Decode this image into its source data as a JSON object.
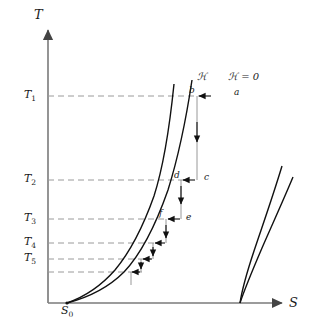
{
  "figure": {
    "type": "diagram",
    "axes": {
      "y_label": "T",
      "x_label": "S",
      "y_axis_name": "temperature-axis",
      "x_axis_name": "entropy-axis"
    },
    "origin_label": "S",
    "origin_subscript": "0",
    "field_labels": [
      {
        "name": "field-on-label",
        "text": "ℋ"
      },
      {
        "name": "field-zero-label",
        "text": "ℋ = 0"
      }
    ],
    "isotherms": [
      {
        "id": "T1",
        "label": "T",
        "subscript": "1",
        "y": 96,
        "x_end": 206,
        "style": "dashed"
      },
      {
        "id": "T2",
        "label": "T",
        "subscript": "2",
        "y": 180,
        "x_end": 188,
        "style": "dashed"
      },
      {
        "id": "T3",
        "label": "T",
        "subscript": "3",
        "y": 219,
        "x_end": 172,
        "style": "dashed"
      },
      {
        "id": "T4",
        "label": "T",
        "subscript": "4",
        "y": 243,
        "x_end": 160,
        "style": "dashed"
      },
      {
        "id": "T5",
        "label": "T",
        "subscript": "5",
        "y": 259,
        "x_end": 151,
        "style": "dashed"
      },
      {
        "id": "T6",
        "label": "",
        "subscript": "",
        "y": 272,
        "x_end": 142,
        "style": "dashed"
      }
    ],
    "points": [
      {
        "id": "a",
        "label": "a",
        "x": 212,
        "y": 96
      },
      {
        "id": "b",
        "label": "b",
        "x": 196,
        "y": 96
      },
      {
        "id": "c",
        "label": "c",
        "x": 196,
        "y": 180
      },
      {
        "id": "d",
        "label": "d",
        "x": 180,
        "y": 180
      },
      {
        "id": "e",
        "label": "e",
        "x": 181,
        "y": 219
      },
      {
        "id": "f",
        "label": "f",
        "x": 165,
        "y": 219
      }
    ],
    "process_arrows": [
      {
        "name": "isothermal-magnetization-a-to-b",
        "direction": "left",
        "from": [
          210,
          96
        ],
        "to": [
          199,
          96
        ]
      },
      {
        "name": "adiabatic-demagnetization-b-to-c",
        "direction": "down",
        "from": [
          197,
          100
        ],
        "to": [
          197,
          178
        ]
      },
      {
        "name": "isothermal-magnetization-c-to-d",
        "direction": "left",
        "from": [
          194,
          180
        ],
        "to": [
          183,
          180
        ]
      },
      {
        "name": "adiabatic-demagnetization-d-to-e",
        "direction": "down",
        "from": [
          181,
          184
        ],
        "to": [
          181,
          216
        ]
      },
      {
        "name": "isothermal-magnetization-e-to-f",
        "direction": "left",
        "from": [
          179,
          219
        ],
        "to": [
          168,
          219
        ]
      },
      {
        "name": "adiabatic-demagnetization-f-to-g",
        "direction": "down",
        "from": [
          166,
          222
        ],
        "to": [
          166,
          241
        ]
      },
      {
        "name": "isothermal-magnetization-g-to-h",
        "direction": "left",
        "from": [
          164,
          243
        ],
        "to": [
          155,
          243
        ]
      },
      {
        "name": "adiabatic-demagnetization-h-to-i",
        "direction": "down",
        "from": [
          153,
          246
        ],
        "to": [
          153,
          257
        ]
      },
      {
        "name": "isothermal-magnetization-i-to-j",
        "direction": "left",
        "from": [
          151,
          259
        ],
        "to": [
          143,
          259
        ]
      },
      {
        "name": "adiabatic-demagnetization-j-to-k",
        "direction": "down",
        "from": [
          141,
          262
        ],
        "to": [
          141,
          270
        ]
      }
    ],
    "curves": [
      {
        "name": "entropy-curve-field-on",
        "points": "67,303 84,296 100,285 114,271 127,254 139,234 150,209 159,181 166,148 171,114 174,84"
      },
      {
        "name": "entropy-curve-field-zero",
        "points": "67,303 88,297 105,288 120,275 133,258 146,236 158,208 170,173 180,134 188,99 192,80"
      },
      {
        "name": "right-curve-inner",
        "points": "240,303 243,290 248,272 254,251 261,228 269,203 276,181 282,166"
      },
      {
        "name": "right-curve-outer",
        "points": "240,303 246,288 254,269 263,248 272,227 281,207 288,190 293,177"
      }
    ]
  }
}
